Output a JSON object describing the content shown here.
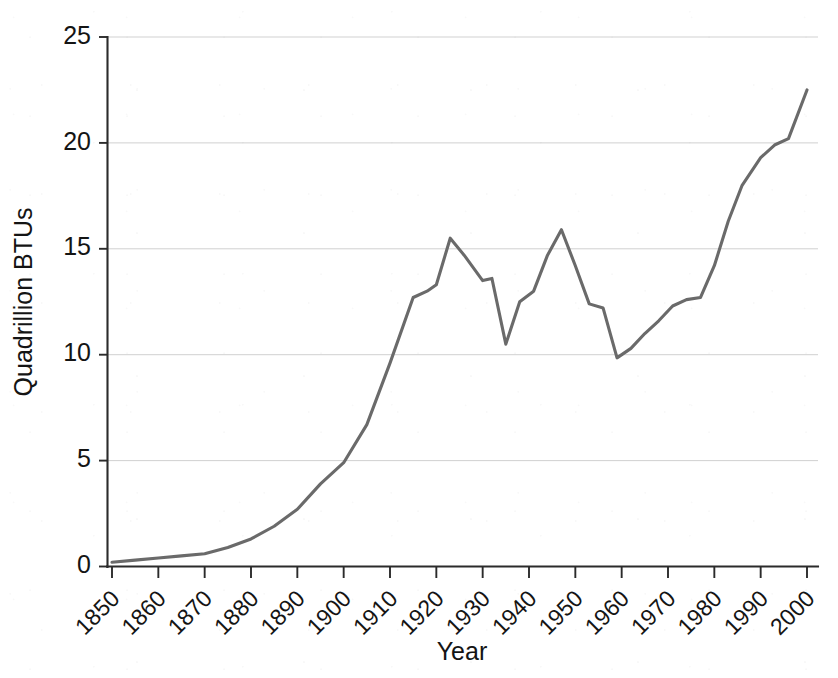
{
  "chart_data": {
    "type": "line",
    "title": "",
    "subtitle": "",
    "xlabel": "Year",
    "ylabel": "Quadrillion BTUs",
    "xlim": [
      1850,
      2000
    ],
    "ylim": [
      0,
      25
    ],
    "grid": "horizontal",
    "legend": "none",
    "line_color": "#6a6a6a",
    "axis_color": "#2b2b2b",
    "grid_color": "#c9c9c9",
    "background_color": "#ffffff",
    "x_ticks": [
      1850,
      1860,
      1870,
      1880,
      1890,
      1900,
      1910,
      1920,
      1930,
      1940,
      1950,
      1960,
      1970,
      1980,
      1990,
      2000
    ],
    "x_tick_labels": [
      "1850",
      "1860",
      "1870",
      "1880",
      "1890",
      "1900",
      "1910",
      "1920",
      "1930",
      "1940",
      "1950",
      "1960",
      "1970",
      "1980",
      "1990",
      "2000"
    ],
    "x_tick_rotation": 45,
    "y_ticks": [
      0,
      5,
      10,
      15,
      20,
      25
    ],
    "y_tick_labels": [
      "0",
      "5",
      "10",
      "15",
      "20",
      "25"
    ],
    "series": [
      {
        "name": "Energy consumption",
        "color": "#6a6a6a",
        "x": [
          1850,
          1855,
          1860,
          1865,
          1870,
          1875,
          1880,
          1885,
          1890,
          1895,
          1900,
          1905,
          1910,
          1915,
          1918,
          1920,
          1923,
          1926,
          1930,
          1932,
          1935,
          1938,
          1941,
          1944,
          1947,
          1950,
          1953,
          1956,
          1959,
          1962,
          1965,
          1968,
          1971,
          1974,
          1977,
          1980,
          1983,
          1986,
          1990,
          1993,
          1996,
          2000
        ],
        "y": [
          0.2,
          0.3,
          0.4,
          0.5,
          0.6,
          0.9,
          1.3,
          1.9,
          2.7,
          3.9,
          4.9,
          6.7,
          9.6,
          12.7,
          13.0,
          13.3,
          15.5,
          14.7,
          13.5,
          13.6,
          10.5,
          12.5,
          13.0,
          14.7,
          15.9,
          14.2,
          12.4,
          12.2,
          9.85,
          10.3,
          11.0,
          11.6,
          12.3,
          12.6,
          12.7,
          14.2,
          16.3,
          18.0,
          19.3,
          19.9,
          20.2,
          22.5
        ]
      }
    ],
    "annotations": {
      "peak_1923": 15.5,
      "depression_low_1935": 10.5,
      "wwii_peak_1947": 15.9,
      "low_1959": 9.85,
      "final_2000": 22.5
    }
  }
}
